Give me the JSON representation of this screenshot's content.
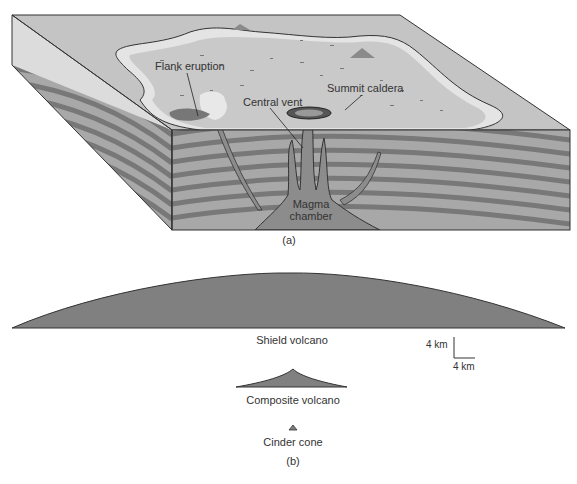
{
  "panel_a": {
    "caption": "(a)",
    "labels": {
      "flank_eruption": "Flank eruption",
      "central_vent": "Central vent",
      "summit_caldera": "Summit caldera",
      "magma_chamber_line1": "Magma",
      "magma_chamber_line2": "chamber"
    }
  },
  "panel_b": {
    "caption": "(b)",
    "volcanoes": [
      {
        "name": "Shield volcano"
      },
      {
        "name": "Composite volcano"
      },
      {
        "name": "Cinder cone"
      }
    ],
    "scale_bar": {
      "vertical": "4 km",
      "horizontal": "4 km"
    }
  },
  "colors": {
    "surface": "#c9c9c9",
    "surface_light": "#e6e6e6",
    "layer_dark": "#7a7a7a",
    "layer_light": "#a9a9a9",
    "magma": "#8c8c8c",
    "volcano_fill": "#808080",
    "outline": "#333333"
  }
}
